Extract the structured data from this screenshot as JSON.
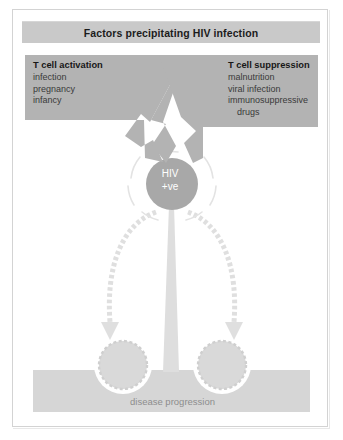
{
  "figure": {
    "title": "Factors precipitating HIV infection",
    "background_color": "#ffffff",
    "frame_color": "#d3d3d3",
    "title_bar_color": "#c9c9c9"
  },
  "boxes": {
    "left": {
      "heading": "T cell activation",
      "items": [
        "infection",
        "pregnancy",
        "infancy"
      ],
      "fill_color": "#b3b3b3"
    },
    "right": {
      "heading": "T cell suppression",
      "items": [
        "malnutrition",
        "viral infection",
        "immunosuppressive",
        "drugs"
      ],
      "fill_color": "#b3b3b3"
    }
  },
  "center_node": {
    "line1": "HIV",
    "line2": "+ve",
    "fill_color": "#a8a8a8",
    "text_color": "#ffffff"
  },
  "outcome": {
    "bar_label": "disease progression",
    "bar_color": "#d6d6d6",
    "label_color": "#8d8d8d",
    "node_count": 2
  },
  "flow": {
    "arrow_color": "#dcdcdc",
    "wedge_color": "#dedede"
  }
}
